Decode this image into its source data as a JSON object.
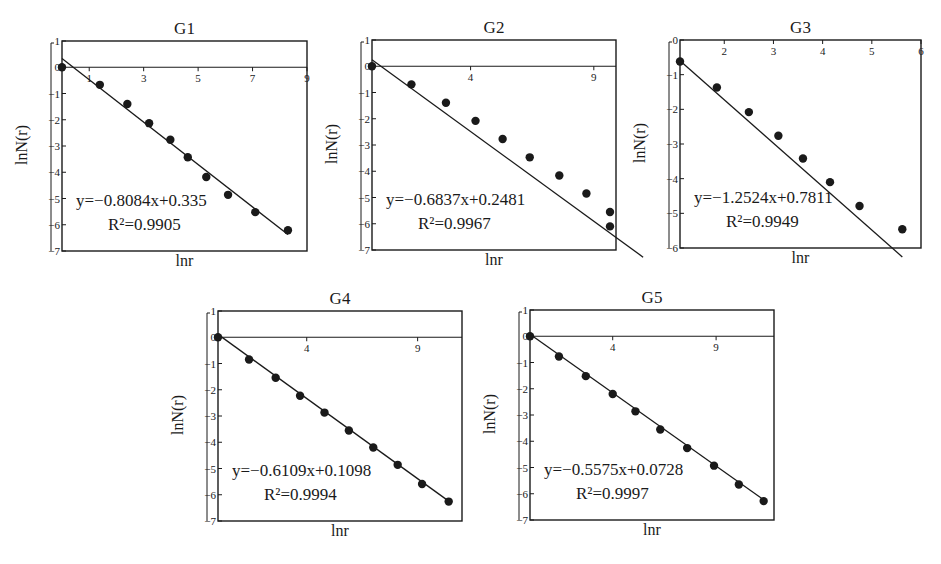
{
  "chart_data": [
    {
      "type": "scatter",
      "title": "G1",
      "xlabel": "lnr",
      "ylabel": "lnN(r)",
      "xlim": [
        0,
        9
      ],
      "ylim": [
        -7,
        1
      ],
      "xticks": [
        1,
        3,
        5,
        7,
        9
      ],
      "yticks": [
        1,
        0,
        -1,
        -2,
        -3,
        -4,
        -5,
        -6,
        -7
      ],
      "grid": false,
      "x": [
        0,
        1.39,
        2.4,
        3.2,
        3.98,
        4.62,
        5.3,
        6.1,
        7.1,
        8.3
      ],
      "y": [
        0,
        -0.67,
        -1.4,
        -2.13,
        -2.76,
        -3.43,
        -4.18,
        -4.86,
        -5.52,
        -6.21
      ],
      "fit": {
        "slope": -0.8084,
        "intercept": 0.335,
        "r2": 0.9905
      },
      "equation_text": "y=−0.8084x+0.335",
      "r2_text": "R²=0.9905"
    },
    {
      "type": "scatter",
      "title": "G2",
      "xlabel": "lnr",
      "ylabel": "lnN(r)",
      "xlim": [
        0,
        9.9
      ],
      "ylim": [
        -7,
        1
      ],
      "xticks": [
        4,
        9
      ],
      "yticks": [
        1,
        0,
        -1,
        -2,
        -3,
        -4,
        -5,
        -6,
        -7
      ],
      "grid": false,
      "x": [
        0,
        1.6,
        3.0,
        4.2,
        5.3,
        6.4,
        7.6,
        8.7,
        9.7,
        11.0
      ],
      "y": [
        0,
        -0.69,
        -1.39,
        -2.08,
        -2.77,
        -3.47,
        -4.16,
        -4.85,
        -5.55,
        -6.1
      ],
      "fit": {
        "slope": -0.6837,
        "intercept": 0.2481,
        "r2": 0.9967
      },
      "equation_text": "y=−0.6837x+0.2481",
      "r2_text": "R²=0.9967"
    },
    {
      "type": "scatter",
      "title": "G3",
      "xlabel": "lnr",
      "ylabel": "lnN(r)",
      "xlim": [
        1.1,
        6
      ],
      "ylim": [
        -6,
        0
      ],
      "xticks": [
        2,
        3,
        4,
        5,
        6
      ],
      "yticks": [
        0,
        -1,
        -2,
        -3,
        -4,
        -5,
        -6
      ],
      "grid": false,
      "x": [
        1.1,
        1.85,
        2.5,
        3.1,
        3.6,
        4.15,
        4.75,
        5.62
      ],
      "y": [
        -0.62,
        -1.37,
        -2.08,
        -2.76,
        -3.42,
        -4.1,
        -4.79,
        -5.46
      ],
      "fit": {
        "slope": -1.2524,
        "intercept": 0.7811,
        "r2": 0.9949
      },
      "equation_text": "y=−1.2524x+0.7811",
      "r2_text": "R²=0.9949"
    },
    {
      "type": "scatter",
      "title": "G4",
      "xlabel": "lnr",
      "ylabel": "lnN(r)",
      "xlim": [
        0,
        11
      ],
      "ylim": [
        -7,
        1
      ],
      "xticks": [
        4,
        9
      ],
      "yticks": [
        1,
        0,
        -1,
        -2,
        -3,
        -4,
        -5,
        -6,
        -7
      ],
      "grid": false,
      "x": [
        0,
        1.4,
        2.6,
        3.7,
        4.8,
        5.9,
        7.0,
        8.1,
        9.2,
        10.4
      ],
      "y": [
        0,
        -0.85,
        -1.54,
        -2.23,
        -2.87,
        -3.55,
        -4.2,
        -4.86,
        -5.59,
        -6.26
      ],
      "fit": {
        "slope": -0.6109,
        "intercept": 0.1098,
        "r2": 0.9994
      },
      "equation_text": "y=−0.6109x+0.1098",
      "r2_text": "R²=0.9994"
    },
    {
      "type": "scatter",
      "title": "G5",
      "xlabel": "lnr",
      "ylabel": "lnN(r)",
      "xlim": [
        0,
        11.8
      ],
      "ylim": [
        -7,
        1
      ],
      "xticks": [
        4,
        9
      ],
      "yticks": [
        1,
        0,
        -1,
        -2,
        -3,
        -4,
        -5,
        -6,
        -7
      ],
      "grid": false,
      "x": [
        0,
        1.4,
        2.7,
        4.0,
        5.1,
        6.3,
        7.6,
        8.9,
        10.1,
        11.3
      ],
      "y": [
        0,
        -0.77,
        -1.52,
        -2.2,
        -2.86,
        -3.55,
        -4.26,
        -4.93,
        -5.65,
        -6.28
      ],
      "fit": {
        "slope": -0.5575,
        "intercept": 0.0728,
        "r2": 0.9997
      },
      "equation_text": "y=−0.5575x+0.0728",
      "r2_text": "R²=0.9997"
    }
  ],
  "panels": [
    {
      "title": "G1",
      "xlabel": "lnr",
      "ylabel": "lnN(r)",
      "equation": "y=−0.8084x+0.335",
      "r2": "R²=0.9905"
    },
    {
      "title": "G2",
      "xlabel": "lnr",
      "ylabel": "lnN(r)",
      "equation": "y=−0.6837x+0.2481",
      "r2": "R²=0.9967"
    },
    {
      "title": "G3",
      "xlabel": "lnr",
      "ylabel": "lnN(r)",
      "equation": "y=−1.2524x+0.7811",
      "r2": "R²=0.9949"
    },
    {
      "title": "G4",
      "xlabel": "lnr",
      "ylabel": "lnN(r)",
      "equation": "y=−0.6109x+0.1098",
      "r2": "R²=0.9994"
    },
    {
      "title": "G5",
      "xlabel": "lnr",
      "ylabel": "lnN(r)",
      "equation": "y=−0.5575x+0.0728",
      "r2": "R²=0.9997"
    }
  ],
  "colors": {
    "ink": "#1a1a1a",
    "background": "#ffffff"
  }
}
